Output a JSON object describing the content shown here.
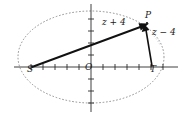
{
  "figure": {
    "background_color": "#ffffff",
    "stroke_color": "#1a1a1a",
    "dotted_color": "#8a8a8a",
    "width": 186,
    "height": 116
  },
  "labels": {
    "focus_left": "S",
    "origin": "O",
    "focus_right": "T",
    "point": "P",
    "vector_from_S": "z + 4",
    "vector_from_T": "z − 4"
  },
  "geometry": {
    "ellipse": {
      "center_x": 91,
      "center_y": 57,
      "radius_x": 73,
      "radius_y": 46,
      "style": "dotted"
    },
    "x_axis": {
      "x1": 14,
      "y1": 67,
      "x2": 178,
      "y2": 67
    },
    "y_axis": {
      "x1": 91,
      "y1": 4,
      "x2": 91,
      "y2": 112
    },
    "tick_spacing": 12,
    "tick_length": 4,
    "points": {
      "S": {
        "x": 32,
        "y": 67
      },
      "O": {
        "x": 91,
        "y": 67
      },
      "T": {
        "x": 152,
        "y": 67
      },
      "P": {
        "x": 147,
        "y": 23
      }
    },
    "vectors": [
      {
        "name": "S-to-P",
        "from": "S",
        "to": "P"
      },
      {
        "name": "T-to-P",
        "from": "T",
        "to": "P"
      }
    ]
  }
}
